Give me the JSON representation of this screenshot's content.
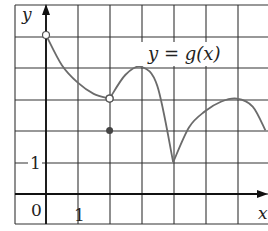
{
  "chart_data": {
    "type": "line",
    "title": "",
    "function_label": "y = g(x)",
    "xlabel": "x",
    "ylabel": "y",
    "x_tick_labels": [
      {
        "value": 0,
        "label": "0"
      },
      {
        "value": 1,
        "label": "1"
      }
    ],
    "y_tick_labels": [
      {
        "value": 1,
        "label": "1"
      }
    ],
    "xlim": [
      -1,
      6.9
    ],
    "ylim": [
      -1,
      6
    ],
    "grid": true,
    "grid_step": 1,
    "segments": [
      {
        "name": "decreasing-branch",
        "points": [
          [
            0,
            5
          ],
          [
            0.5,
            4.05
          ],
          [
            1,
            3.5
          ],
          [
            1.5,
            3.15
          ],
          [
            2,
            3
          ]
        ],
        "start": {
          "x": 0,
          "y": 5,
          "marker": "open"
        },
        "end": {
          "x": 2,
          "y": 3,
          "marker": "open"
        }
      },
      {
        "name": "rising-then-falling-branch",
        "points": [
          [
            2,
            3
          ],
          [
            2.5,
            3.75
          ],
          [
            3,
            4
          ],
          [
            3.5,
            3.4
          ],
          [
            4,
            1
          ]
        ],
        "start": {
          "x": 2,
          "y": 3,
          "marker": "open"
        },
        "end": {
          "x": 4,
          "y": 1,
          "marker": "none"
        }
      },
      {
        "name": "right-arc",
        "points": [
          [
            4,
            1
          ],
          [
            4.5,
            2.1
          ],
          [
            5,
            2.6
          ],
          [
            5.5,
            2.9
          ],
          [
            6,
            3
          ],
          [
            6.5,
            2.75
          ],
          [
            6.9,
            2
          ]
        ],
        "start": {
          "x": 4,
          "y": 1,
          "marker": "none"
        },
        "end": {
          "x": 6.9,
          "y": 2,
          "marker": "none"
        }
      }
    ],
    "isolated_points": [
      {
        "x": 2,
        "y": 2,
        "marker": "filled"
      }
    ],
    "notable_points": [
      {
        "x": 0,
        "y": 5,
        "note": "open circle"
      },
      {
        "x": 2,
        "y": 3,
        "note": "open circle (removable discontinuity)"
      },
      {
        "x": 2,
        "y": 2,
        "note": "filled dot, g(2)=2"
      },
      {
        "x": 3,
        "y": 4,
        "note": "local maximum"
      },
      {
        "x": 4,
        "y": 1,
        "note": "cusp / local minimum"
      },
      {
        "x": 6,
        "y": 3,
        "note": "local maximum"
      }
    ]
  },
  "labels": {
    "y_axis": "y",
    "x_axis": "x",
    "origin": "0",
    "x_one": "1",
    "y_one": "1",
    "function_eq": "y = g(x)"
  }
}
